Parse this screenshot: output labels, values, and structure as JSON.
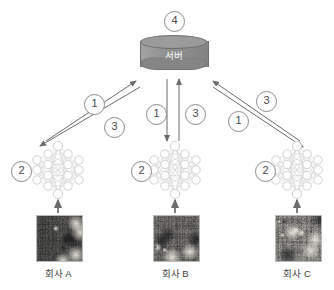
{
  "diagram": {
    "title_hidden": "",
    "server": {
      "label": "서버",
      "badge": "4",
      "color": "#8f8f8f"
    },
    "branches": [
      {
        "company_label": "회사 A",
        "model_badge": "2",
        "up_arrow_label": "1",
        "down_arrow_label": "3"
      },
      {
        "company_label": "회사 B",
        "model_badge": "2",
        "up_arrow_label": "3",
        "down_arrow_label": "1"
      },
      {
        "company_label": "회사 C",
        "model_badge": "2",
        "up_arrow_label": "3",
        "down_arrow_label": "1"
      }
    ],
    "legend_numbers": [
      "1",
      "2",
      "3",
      "4"
    ],
    "colors": {
      "arrow": "#6b6b6b",
      "node_stroke": "#d7d7d7",
      "edge": "#c4c4c4",
      "badge_stroke": "#8a8a8a",
      "text": "#3a3a3a"
    }
  }
}
